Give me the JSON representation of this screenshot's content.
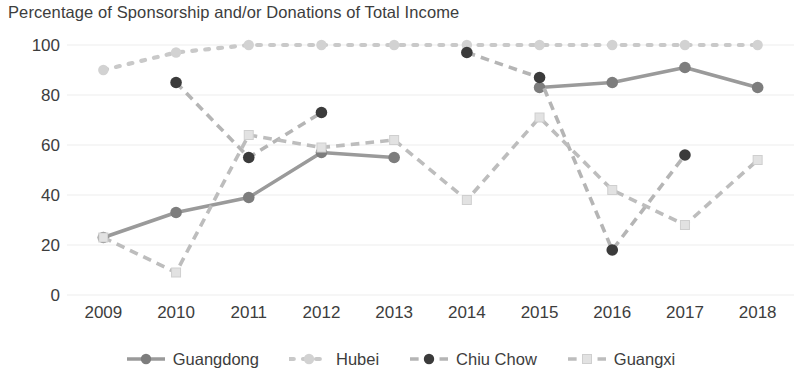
{
  "chart_data": {
    "type": "line",
    "title": "Percentage of Sponsorship and/or Donations of Total Income",
    "xlabel": "",
    "ylabel": "",
    "categories": [
      "2009",
      "2010",
      "2011",
      "2012",
      "2013",
      "2014",
      "2015",
      "2016",
      "2017",
      "2018"
    ],
    "x": [
      2009,
      2010,
      2011,
      2012,
      2013,
      2014,
      2015,
      2016,
      2017,
      2018
    ],
    "ylim": [
      0,
      100
    ],
    "yticks": [
      0,
      20,
      40,
      60,
      80,
      100
    ],
    "grid": true,
    "legend_position": "bottom",
    "series": [
      {
        "name": "Guangdong",
        "color": "#9a9a9a",
        "line_style": "solid",
        "marker": "circle",
        "marker_color": "#7d7d7d",
        "values": [
          23,
          33,
          39,
          57,
          55,
          null,
          83,
          85,
          91,
          83
        ]
      },
      {
        "name": "Hubei",
        "color": "#c9c9c9",
        "line_style": "dotted",
        "marker": "circle",
        "marker_color": "#d2d2d2",
        "values": [
          90,
          97,
          100,
          100,
          100,
          100,
          100,
          100,
          100,
          100
        ]
      },
      {
        "name": "Chiu Chow",
        "color": "#b5b5b5",
        "line_style": "dashed",
        "marker": "circle",
        "marker_color": "#3b3b3b",
        "values": [
          null,
          85,
          55,
          73,
          null,
          97,
          87,
          18,
          56,
          null
        ]
      },
      {
        "name": "Guangxi",
        "color": "#bdbdbd",
        "line_style": "dashed",
        "marker": "square",
        "marker_color": "#e2e2e2",
        "values": [
          23,
          9,
          64,
          59,
          62,
          38,
          71,
          42,
          28,
          54
        ]
      }
    ]
  },
  "legend": {
    "items": [
      {
        "label": "Guangdong"
      },
      {
        "label": "Hubei"
      },
      {
        "label": "Chiu Chow"
      },
      {
        "label": "Guangxi"
      }
    ]
  }
}
